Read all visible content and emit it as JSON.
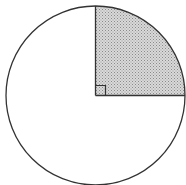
{
  "figure": {
    "type": "circle-with-shaded-sector",
    "center": [
      95.5,
      95.5
    ],
    "radius": 89.5,
    "sector": {
      "start_angle_deg": 0,
      "end_angle_deg": 90,
      "fraction": 0.25,
      "fill": "stipple-gray",
      "right_angle_marker": true
    },
    "colors": {
      "stroke": "#333333",
      "fill_base": "#d6d6d6",
      "fill_dots": "#8a8a8a",
      "background": "#ffffff"
    }
  }
}
